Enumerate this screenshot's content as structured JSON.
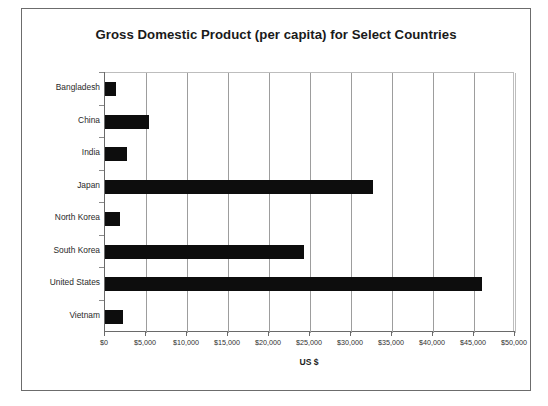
{
  "figure": {
    "title": "Gross Domestic Product (per capita) for Select Countries",
    "x_axis_title": "US $",
    "frame_color": "#6c6c6c",
    "bar_color": "#0d0d0d",
    "gridline_color": "#9d9d9d",
    "background_color": "#ffffff"
  },
  "chart_data": {
    "type": "bar",
    "orientation": "horizontal",
    "title": "Gross Domestic Product (per capita) for Select Countries",
    "xlabel": "US $",
    "ylabel": "",
    "categories": [
      "Bangladesh",
      "China",
      "India",
      "Japan",
      "North Korea",
      "South Korea",
      "United States",
      "Vietnam"
    ],
    "values": [
      1300,
      5400,
      2700,
      32700,
      1800,
      24300,
      46000,
      2200
    ],
    "xlim": [
      0,
      50000
    ],
    "xticks": [
      0,
      5000,
      10000,
      15000,
      20000,
      25000,
      30000,
      35000,
      40000,
      45000,
      50000
    ],
    "xtick_labels": [
      "$0",
      "$5,000",
      "$10,000",
      "$15,000",
      "$20,000",
      "$25,000",
      "$30,000",
      "$35,000",
      "$40,000",
      "$45,000",
      "$50,000"
    ],
    "grid": "vertical",
    "legend": null,
    "series": [
      {
        "name": "GDP per capita",
        "values": [
          1300,
          5400,
          2700,
          32700,
          1800,
          24300,
          46000,
          2200
        ]
      }
    ]
  }
}
